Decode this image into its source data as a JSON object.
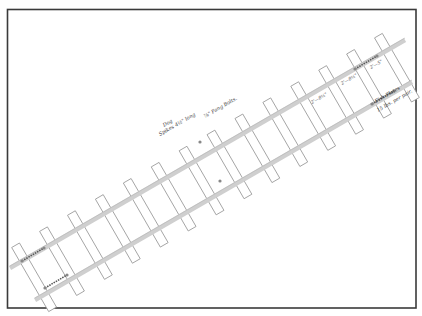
{
  "drawing": {
    "title": "Track plan with fish plates",
    "frame": {
      "x": 7,
      "y": 9,
      "width": 409,
      "height": 299,
      "color": "#3a3a3a"
    },
    "rail_color": "#cfcfcf",
    "tie_stroke": "#9a9a9a",
    "annotations": {
      "spikes_line1": "Dog",
      "spikes_line2": "Spikes 4½\" long",
      "bolts": "⅞\" Fang Bolts.",
      "fish_plates_line1": "Fish Plates",
      "fish_plates_line2": "15 lbs. per pair.",
      "dim_1": "2'—8½\"",
      "dim_2": "2'—8½\"",
      "dim_3": "2'—5\""
    },
    "rails": [
      {
        "name": "upper-rail",
        "x1": 10,
        "y1": 268,
        "x2": 405,
        "y2": 40
      },
      {
        "name": "lower-rail",
        "x1": 35,
        "y1": 300,
        "x2": 412,
        "y2": 82
      }
    ],
    "tie_count": 14
  }
}
